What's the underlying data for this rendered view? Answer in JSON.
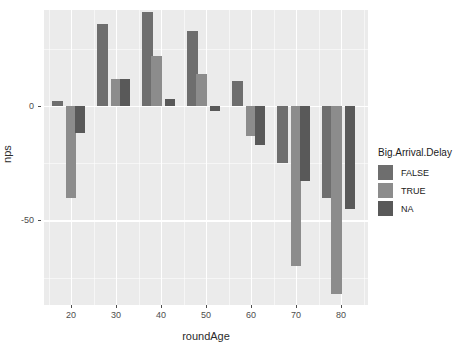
{
  "chart_data": {
    "type": "bar",
    "title": "",
    "subtitle": "",
    "xlabel": "roundAge",
    "ylabel": "nps",
    "xlim": [
      14,
      86
    ],
    "ylim": [
      -87,
      42
    ],
    "xticks": [
      20,
      30,
      40,
      50,
      60,
      70,
      80
    ],
    "yticks": [
      0,
      -50
    ],
    "grid": true,
    "grid_color": "#ffffff",
    "panel_background": "#ebebeb",
    "legend": {
      "title": "Big.Arrival.Delay",
      "position": "right",
      "entries": [
        {
          "label": "FALSE",
          "color": "#6e6e6e"
        },
        {
          "label": "TRUE",
          "color": "#8c8c8c"
        },
        {
          "label": "NA",
          "color": "#595959"
        }
      ]
    },
    "categories": [
      17,
      22,
      27,
      32,
      37,
      42,
      47,
      52,
      57,
      62,
      67,
      72,
      77,
      82
    ],
    "series": [
      {
        "name": "FALSE",
        "color": "#6e6e6e",
        "values": [
          2,
          null,
          36,
          null,
          41,
          null,
          33,
          null,
          11,
          null,
          -25,
          null,
          -1,
          null
        ]
      },
      {
        "name": "TRUE",
        "color": "#8c8c8c",
        "values": [
          null,
          -40,
          null,
          12,
          null,
          22,
          null,
          14,
          null,
          -13,
          null,
          -70,
          -40,
          null
        ]
      },
      {
        "name": "NA",
        "color": "#595959",
        "values": [
          null,
          -12,
          null,
          12,
          null,
          3,
          null,
          -2,
          null,
          -17,
          null,
          -33,
          null,
          -45
        ]
      }
    ],
    "bars": [
      {
        "x": 17,
        "group": "FALSE",
        "value": 2
      },
      {
        "x": 20,
        "group": "TRUE",
        "value": -40
      },
      {
        "x": 22,
        "group": "NA",
        "value": -12
      },
      {
        "x": 27,
        "group": "FALSE",
        "value": 36
      },
      {
        "x": 30,
        "group": "TRUE",
        "value": 12
      },
      {
        "x": 32,
        "group": "NA",
        "value": 12
      },
      {
        "x": 37,
        "group": "FALSE",
        "value": 41
      },
      {
        "x": 39,
        "group": "TRUE",
        "value": 22
      },
      {
        "x": 42,
        "group": "NA",
        "value": 3
      },
      {
        "x": 47,
        "group": "FALSE",
        "value": 33
      },
      {
        "x": 49,
        "group": "TRUE",
        "value": 14
      },
      {
        "x": 52,
        "group": "NA",
        "value": -2
      },
      {
        "x": 57,
        "group": "FALSE",
        "value": 11
      },
      {
        "x": 60,
        "group": "TRUE",
        "value": -13
      },
      {
        "x": 62,
        "group": "NA",
        "value": -17
      },
      {
        "x": 67,
        "group": "FALSE",
        "value": -25
      },
      {
        "x": 70,
        "group": "TRUE",
        "value": -70
      },
      {
        "x": 72,
        "group": "NA",
        "value": -33
      },
      {
        "x": 77,
        "group": "FALSE",
        "value": -40
      },
      {
        "x": 79,
        "group": "TRUE",
        "value": -82
      },
      {
        "x": 82,
        "group": "NA",
        "value": -45
      }
    ]
  }
}
